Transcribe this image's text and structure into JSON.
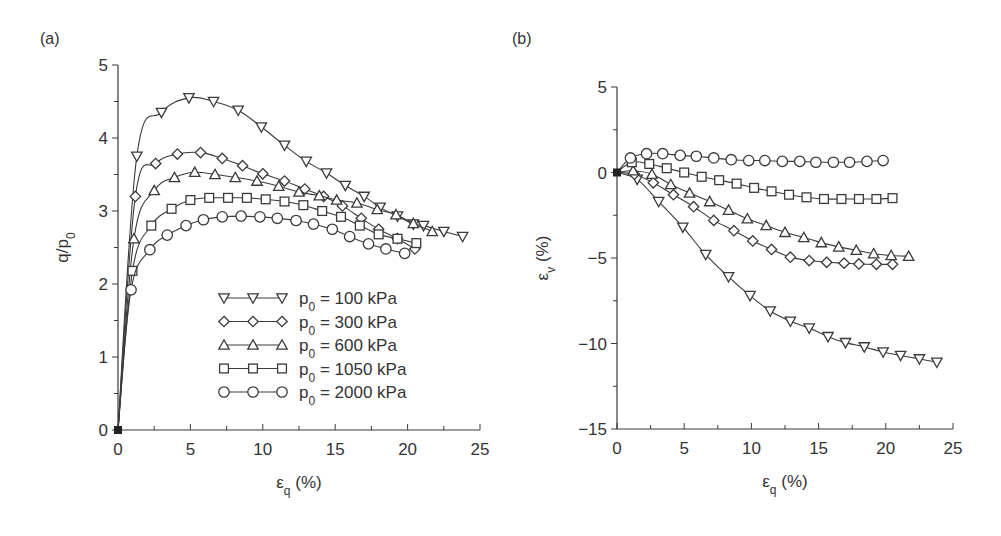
{
  "figure": {
    "panel_a_label": "(a)",
    "panel_b_label": "(b)"
  },
  "chart_data": [
    {
      "type": "line",
      "panel": "(a)",
      "title": "",
      "xlabel": "εq (%)",
      "ylabel": "q/p0",
      "xlim": [
        0,
        25
      ],
      "ylim": [
        0,
        5
      ],
      "xticks": [
        "0",
        "5",
        "10",
        "15",
        "20",
        "25"
      ],
      "yticks": [
        "0",
        "1",
        "2",
        "3",
        "4",
        "5"
      ],
      "grid": false,
      "legend_position": "lower right (inside)",
      "legend": [
        "p0 = 100 kPa",
        "p0 = 300 kPa",
        "p0 = 600 kPa",
        "p0 = 1050 kPa",
        "p0 = 2000 kPa"
      ],
      "series": [
        {
          "name": "p0 = 100 kPa",
          "marker": "triangle-down",
          "x": [
            0,
            1.3,
            3.0,
            4.9,
            6.6,
            8.3,
            9.9,
            11.5,
            13.0,
            14.4,
            15.7,
            17.0,
            18.1,
            19.3,
            20.4,
            21.1,
            22.5,
            23.8
          ],
          "y": [
            0,
            3.75,
            4.35,
            4.55,
            4.5,
            4.38,
            4.15,
            3.9,
            3.68,
            3.52,
            3.35,
            3.2,
            3.05,
            2.93,
            2.82,
            2.8,
            2.72,
            2.65
          ]
        },
        {
          "name": "p0 = 300 kPa",
          "marker": "diamond",
          "x": [
            0,
            1.2,
            2.6,
            4.1,
            5.7,
            7.2,
            8.6,
            10.0,
            11.5,
            12.9,
            14.2,
            15.5,
            16.8,
            18.0,
            19.3,
            20.5
          ],
          "y": [
            0,
            3.2,
            3.65,
            3.78,
            3.8,
            3.72,
            3.62,
            3.51,
            3.41,
            3.3,
            3.2,
            3.07,
            2.9,
            2.75,
            2.62,
            2.48
          ]
        },
        {
          "name": "p0 = 600 kPa",
          "marker": "triangle-up",
          "x": [
            0,
            1.1,
            2.5,
            3.9,
            5.3,
            6.7,
            8.1,
            9.6,
            11.1,
            12.5,
            13.9,
            15.1,
            16.5,
            17.9,
            19.2,
            20.4,
            21.7
          ],
          "y": [
            0,
            2.62,
            3.28,
            3.46,
            3.53,
            3.5,
            3.46,
            3.41,
            3.34,
            3.26,
            3.21,
            3.15,
            3.11,
            3.02,
            2.95,
            2.83,
            2.72
          ]
        },
        {
          "name": "p0 = 1050 kPa",
          "marker": "square",
          "x": [
            0,
            1.0,
            2.3,
            3.7,
            5.0,
            6.3,
            7.6,
            8.9,
            10.2,
            11.5,
            12.8,
            14.1,
            15.4,
            16.7,
            18.0,
            19.3,
            20.6
          ],
          "y": [
            0,
            2.18,
            2.8,
            3.03,
            3.15,
            3.18,
            3.18,
            3.18,
            3.16,
            3.13,
            3.08,
            3.0,
            2.92,
            2.8,
            2.68,
            2.62,
            2.56
          ]
        },
        {
          "name": "p0 = 2000 kPa",
          "marker": "circle",
          "x": [
            0,
            0.9,
            2.2,
            3.4,
            4.7,
            5.9,
            7.2,
            8.5,
            9.8,
            11.0,
            12.3,
            13.5,
            14.8,
            16.0,
            17.3,
            18.5,
            19.8
          ],
          "y": [
            0,
            1.92,
            2.47,
            2.67,
            2.8,
            2.88,
            2.92,
            2.93,
            2.92,
            2.9,
            2.87,
            2.82,
            2.75,
            2.65,
            2.55,
            2.48,
            2.42
          ]
        }
      ]
    },
    {
      "type": "line",
      "panel": "(b)",
      "title": "",
      "xlabel": "εq (%)",
      "ylabel": "εv (%)",
      "xlim": [
        0,
        25
      ],
      "ylim": [
        -15,
        5
      ],
      "xticks": [
        "0",
        "5",
        "10",
        "15",
        "20",
        "25"
      ],
      "yticks": [
        "−15",
        "−10",
        "−5",
        "0",
        "5"
      ],
      "grid": false,
      "series": [
        {
          "name": "p0 = 100 kPa",
          "marker": "triangle-down",
          "x": [
            0,
            1.5,
            3.1,
            4.9,
            6.6,
            8.3,
            9.9,
            11.4,
            12.9,
            14.3,
            15.7,
            17.0,
            18.4,
            19.8,
            21.1,
            22.5,
            23.8
          ],
          "y": [
            0,
            -0.4,
            -1.7,
            -3.2,
            -4.8,
            -6.1,
            -7.2,
            -8.1,
            -8.7,
            -9.1,
            -9.6,
            -9.95,
            -10.2,
            -10.5,
            -10.7,
            -10.9,
            -11.1
          ]
        },
        {
          "name": "p0 = 300 kPa",
          "marker": "diamond",
          "x": [
            0,
            1.3,
            2.7,
            4.2,
            5.7,
            7.2,
            8.7,
            10.1,
            11.5,
            12.9,
            14.3,
            15.6,
            16.9,
            18.0,
            19.3,
            20.5
          ],
          "y": [
            0,
            -0.1,
            -0.6,
            -1.3,
            -2.0,
            -2.8,
            -3.4,
            -4.0,
            -4.5,
            -4.95,
            -5.15,
            -5.25,
            -5.3,
            -5.35,
            -5.37,
            -5.37
          ]
        },
        {
          "name": "p0 = 600 kPa",
          "marker": "triangle-up",
          "x": [
            0,
            1.2,
            2.6,
            4.0,
            5.4,
            6.9,
            8.3,
            9.7,
            11.1,
            12.5,
            13.9,
            15.2,
            16.5,
            17.8,
            19.1,
            20.4,
            21.7
          ],
          "y": [
            0,
            0.1,
            -0.1,
            -0.7,
            -1.2,
            -1.7,
            -2.2,
            -2.7,
            -3.1,
            -3.5,
            -3.8,
            -4.1,
            -4.35,
            -4.55,
            -4.75,
            -4.85,
            -4.9
          ]
        },
        {
          "name": "p0 = 1050 kPa",
          "marker": "square",
          "x": [
            0,
            1.1,
            2.4,
            3.7,
            5.0,
            6.3,
            7.6,
            8.9,
            10.2,
            11.5,
            12.8,
            14.1,
            15.4,
            16.7,
            18.0,
            19.3,
            20.5
          ],
          "y": [
            0,
            0.6,
            0.5,
            0.25,
            0.0,
            -0.25,
            -0.45,
            -0.65,
            -0.9,
            -1.1,
            -1.3,
            -1.45,
            -1.55,
            -1.55,
            -1.55,
            -1.55,
            -1.5
          ]
        },
        {
          "name": "p0 = 2000 kPa",
          "marker": "circle",
          "x": [
            0,
            1.0,
            2.2,
            3.4,
            4.7,
            5.9,
            7.2,
            8.5,
            9.8,
            11.0,
            12.3,
            13.6,
            14.8,
            16.1,
            17.3,
            18.6,
            19.8
          ],
          "y": [
            0,
            0.85,
            1.1,
            1.1,
            1.0,
            0.95,
            0.85,
            0.75,
            0.7,
            0.7,
            0.65,
            0.65,
            0.6,
            0.6,
            0.6,
            0.65,
            0.7
          ]
        }
      ]
    }
  ]
}
